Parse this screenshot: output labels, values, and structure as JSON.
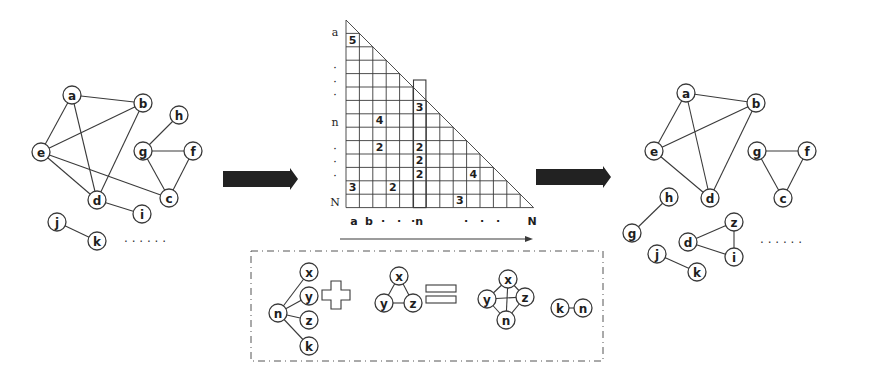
{
  "figure": {
    "left_graph": {
      "nodes": [
        {
          "id": "a",
          "x": 72,
          "y": 95
        },
        {
          "id": "b",
          "x": 143,
          "y": 103
        },
        {
          "id": "e",
          "x": 41,
          "y": 152
        },
        {
          "id": "h",
          "x": 179,
          "y": 115
        },
        {
          "id": "g",
          "x": 143,
          "y": 151
        },
        {
          "id": "f",
          "x": 193,
          "y": 151
        },
        {
          "id": "d",
          "x": 97,
          "y": 200
        },
        {
          "id": "c",
          "x": 169,
          "y": 198
        },
        {
          "id": "i",
          "x": 142,
          "y": 214
        },
        {
          "id": "j",
          "x": 57,
          "y": 222
        },
        {
          "id": "k",
          "x": 97,
          "y": 241
        }
      ],
      "edges": [
        [
          "a",
          "b"
        ],
        [
          "a",
          "e"
        ],
        [
          "a",
          "d"
        ],
        [
          "b",
          "e"
        ],
        [
          "b",
          "d"
        ],
        [
          "e",
          "d"
        ],
        [
          "e",
          "c"
        ],
        [
          "d",
          "i"
        ],
        [
          "g",
          "h"
        ],
        [
          "g",
          "f"
        ],
        [
          "g",
          "c"
        ],
        [
          "f",
          "c"
        ],
        [
          "j",
          "k"
        ]
      ],
      "ellipsis": {
        "text": "· · · · · ·",
        "x": 124,
        "y": 242
      }
    },
    "arrow_left": {
      "x": 223,
      "y": 171,
      "w": 75,
      "h": 16,
      "color": "#222222"
    },
    "matrix": {
      "origin_x": 346,
      "origin_y": 20,
      "cell": 13.4,
      "size": 14,
      "row_labels": [
        {
          "text": "a",
          "row": 1
        },
        {
          "text": "·",
          "row": 4
        },
        {
          "text": "·",
          "row": 5
        },
        {
          "text": "·",
          "row": 6
        },
        {
          "text": "n",
          "row": 8
        },
        {
          "text": "·",
          "row": 10
        },
        {
          "text": "·",
          "row": 11
        },
        {
          "text": "·",
          "row": 12
        },
        {
          "text": "N",
          "row": 14
        }
      ],
      "col_labels": [
        {
          "text": "a",
          "x": 354
        },
        {
          "text": "b",
          "x": 369
        },
        {
          "text": "·",
          "x": 383
        },
        {
          "text": "·",
          "x": 399
        },
        {
          "text": "·n",
          "x": 417
        },
        {
          "text": "·",
          "x": 466
        },
        {
          "text": "·",
          "x": 482
        },
        {
          "text": "·",
          "x": 498
        },
        {
          "text": "N",
          "x": 532
        }
      ],
      "cells": [
        {
          "row": 1,
          "col": 1,
          "value": "5"
        },
        {
          "row": 6,
          "col": 6,
          "value": "3"
        },
        {
          "row": 7,
          "col": 3,
          "value": "4"
        },
        {
          "row": 9,
          "col": 3,
          "value": "2"
        },
        {
          "row": 9,
          "col": 6,
          "value": "2"
        },
        {
          "row": 10,
          "col": 6,
          "value": "2"
        },
        {
          "row": 11,
          "col": 6,
          "value": "2"
        },
        {
          "row": 11,
          "col": 10,
          "value": "4"
        },
        {
          "row": 12,
          "col": 1,
          "value": "3"
        },
        {
          "row": 12,
          "col": 4,
          "value": "2"
        },
        {
          "row": 13,
          "col": 9,
          "value": "3"
        }
      ],
      "highlight_column": {
        "col": 6,
        "top_y": 80
      },
      "axis_arrow": {
        "x1": 340,
        "x2": 533,
        "y": 239
      }
    },
    "arrow_right": {
      "x": 536,
      "y": 169,
      "w": 75,
      "h": 16,
      "color": "#222222"
    },
    "right_graph": {
      "nodes": [
        {
          "id": "a",
          "x": 686,
          "y": 93
        },
        {
          "id": "b",
          "x": 756,
          "y": 103
        },
        {
          "id": "e",
          "x": 654,
          "y": 151
        },
        {
          "id": "d",
          "x": 710,
          "y": 198
        },
        {
          "id": "g",
          "x": 757,
          "y": 151
        },
        {
          "id": "f",
          "x": 807,
          "y": 151
        },
        {
          "id": "c",
          "x": 783,
          "y": 198
        },
        {
          "id": "h",
          "x": 669,
          "y": 197
        },
        {
          "id": "g2",
          "label": "g",
          "x": 632,
          "y": 233
        },
        {
          "id": "z",
          "x": 734,
          "y": 222
        },
        {
          "id": "d2",
          "label": "d",
          "x": 688,
          "y": 242
        },
        {
          "id": "i",
          "x": 734,
          "y": 257
        },
        {
          "id": "j",
          "x": 657,
          "y": 254
        },
        {
          "id": "k",
          "x": 697,
          "y": 272
        }
      ],
      "edges": [
        [
          "a",
          "b"
        ],
        [
          "a",
          "e"
        ],
        [
          "a",
          "d"
        ],
        [
          "b",
          "e"
        ],
        [
          "b",
          "d"
        ],
        [
          "e",
          "d"
        ],
        [
          "g",
          "f"
        ],
        [
          "g",
          "c"
        ],
        [
          "f",
          "c"
        ],
        [
          "h",
          "g2"
        ],
        [
          "z",
          "d2"
        ],
        [
          "z",
          "i"
        ],
        [
          "d2",
          "i"
        ],
        [
          "j",
          "k"
        ]
      ],
      "ellipsis": {
        "text": "· · · · · ·",
        "x": 760,
        "y": 243
      }
    },
    "legend_box": {
      "x": 251,
      "y": 251,
      "w": 352,
      "h": 110,
      "star_graph": {
        "center": {
          "id": "n",
          "x": 278,
          "y": 313
        },
        "leaves": [
          {
            "id": "x",
            "x": 309,
            "y": 272
          },
          {
            "id": "y",
            "x": 309,
            "y": 296
          },
          {
            "id": "z",
            "x": 309,
            "y": 320
          },
          {
            "id": "k",
            "x": 309,
            "y": 346
          }
        ]
      },
      "plus_symbol": {
        "x": 336,
        "y": 295
      },
      "triangle_graph": {
        "nodes": [
          {
            "id": "x",
            "x": 399,
            "y": 276
          },
          {
            "id": "y",
            "x": 384,
            "y": 303
          },
          {
            "id": "z",
            "x": 413,
            "y": 303
          }
        ]
      },
      "equals_symbol": {
        "x": 441,
        "y": 294
      },
      "result_graph": {
        "nodes": [
          {
            "id": "x",
            "x": 508,
            "y": 279
          },
          {
            "id": "y",
            "x": 487,
            "y": 299
          },
          {
            "id": "z",
            "x": 525,
            "y": 297
          },
          {
            "id": "n",
            "x": 506,
            "y": 320
          }
        ]
      },
      "pair_graph": {
        "nodes": [
          {
            "id": "k",
            "x": 560,
            "y": 308
          },
          {
            "id": "n",
            "x": 583,
            "y": 308
          }
        ]
      }
    }
  }
}
